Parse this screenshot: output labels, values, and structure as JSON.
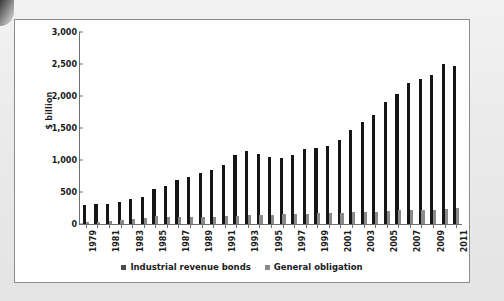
{
  "chart_data": {
    "type": "bar",
    "title": "",
    "xlabel": "",
    "ylabel": "$ billion",
    "ylim": [
      0,
      3000
    ],
    "ytick_labels": [
      "3,000",
      "2,500",
      "2,000",
      "1,500",
      "1,000",
      "500",
      "0"
    ],
    "ytick_values": [
      3000,
      2500,
      2000,
      1500,
      1000,
      500,
      0
    ],
    "grid": false,
    "legend_position": "bottom",
    "categories": [
      "1979",
      "1980",
      "1981",
      "1982",
      "1983",
      "1984",
      "1985",
      "1986",
      "1987",
      "1988",
      "1989",
      "1990",
      "1991",
      "1992",
      "1993",
      "1994",
      "1995",
      "1996",
      "1997",
      "1998",
      "1999",
      "2000",
      "2001",
      "2002",
      "2003",
      "2004",
      "2005",
      "2006",
      "2007",
      "2008",
      "2009",
      "2010",
      "2011"
    ],
    "xtick_labels_shown": [
      "1979",
      "1981",
      "1983",
      "1985",
      "1987",
      "1989",
      "1991",
      "1993",
      "1995",
      "1997",
      "1999",
      "2001",
      "2003",
      "2005",
      "2007",
      "2009",
      "2011"
    ],
    "series": [
      {
        "name": "Industrial revenue bonds",
        "color": "#161616",
        "values": [
          290,
          305,
          315,
          350,
          390,
          425,
          545,
          600,
          680,
          740,
          800,
          850,
          925,
          1075,
          1140,
          1100,
          1045,
          1030,
          1080,
          1170,
          1195,
          1215,
          1320,
          1465,
          1590,
          1705,
          1910,
          2030,
          2210,
          2260,
          2335,
          2500,
          2475
        ]
      },
      {
        "name": "General obligation",
        "color": "#8a8a8a",
        "values": [
          30,
          35,
          40,
          70,
          85,
          95,
          125,
          115,
          115,
          112,
          112,
          115,
          120,
          130,
          135,
          140,
          145,
          150,
          152,
          160,
          170,
          175,
          175,
          180,
          190,
          195,
          210,
          215,
          220,
          222,
          225,
          240,
          255
        ]
      }
    ]
  },
  "legend": {
    "items": [
      {
        "label": "Industrial revenue bonds"
      },
      {
        "label": "General obligation"
      }
    ]
  }
}
